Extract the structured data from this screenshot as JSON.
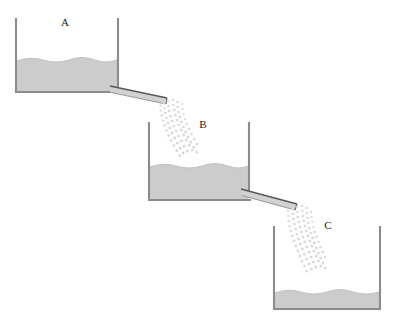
{
  "figure": {
    "type": "physics-diagram",
    "background_color": "#ffffff",
    "canvas": {
      "width": 396,
      "height": 320
    }
  },
  "palette": {
    "wall_stroke": "#8c8c8c",
    "wall_stroke_dark": "#6e6e6e",
    "water_fill": "#cccccc",
    "water_surface_stroke": "#b8b8b8",
    "spout_fill": "#d0d0d0",
    "spout_stroke": "#5a5a5a",
    "stream_dot": "#d9d9d9",
    "label_color": "#1a1a1a"
  },
  "containers": [
    {
      "id": "A",
      "label": "A",
      "label_x": 65,
      "label_y": 26,
      "left_x": 15,
      "right_x": 119,
      "top_y": 18,
      "bottom_y": 92,
      "water_level_y": 60,
      "water_depth": 32,
      "fill_state": "partially-full",
      "wave_amplitude": 3,
      "wave_count": 4
    },
    {
      "id": "B",
      "label": "B",
      "label_x": 203,
      "label_y": 128,
      "left_x": 148,
      "right_x": 249,
      "top_y": 122,
      "bottom_y": 200,
      "water_level_y": 166,
      "water_depth": 34,
      "fill_state": "partially-full",
      "wave_amplitude": 3,
      "wave_count": 4
    },
    {
      "id": "C",
      "label": "C",
      "label_x": 328,
      "label_y": 229,
      "left_x": 273,
      "right_x": 381,
      "top_y": 226,
      "bottom_y": 309,
      "water_level_y": 293,
      "water_depth": 16,
      "fill_state": "nearly-empty",
      "wave_amplitude": 3,
      "wave_count": 5
    }
  ],
  "spouts": [
    {
      "id": "spout-a-to-b",
      "from": "A",
      "to": "B",
      "start_x": 118,
      "start_y": 88,
      "end_x": 166,
      "end_y": 100,
      "thickness": 6
    },
    {
      "id": "spout-b-to-c",
      "from": "B",
      "to": "C",
      "start_x": 248,
      "start_y": 191,
      "end_x": 296,
      "end_y": 206,
      "thickness": 6
    }
  ],
  "streams": [
    {
      "id": "stream-a-to-b",
      "from": "A",
      "to": "B",
      "origin_x": 166,
      "origin_y": 100,
      "terminus_x": 188,
      "terminus_y": 163,
      "columns": 5,
      "dots_per_column": 11,
      "curve": "parabolic-fall"
    },
    {
      "id": "stream-b-to-c",
      "from": "B",
      "to": "C",
      "origin_x": 296,
      "origin_y": 206,
      "terminus_x": 318,
      "terminus_y": 291,
      "columns": 5,
      "dots_per_column": 13,
      "curve": "parabolic-fall"
    }
  ]
}
